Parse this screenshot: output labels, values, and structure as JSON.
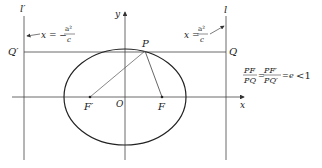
{
  "labels": {
    "l_prime": "l′",
    "l": "l",
    "y_axis": "y",
    "x_axis": "x",
    "origin": "O",
    "Q_prime": "Q′",
    "Q": "Q",
    "P": "P",
    "F_prime": "F′",
    "F": "F"
  },
  "left_directrix_eq": {
    "lhs": "x = −",
    "num": "a²",
    "den": "c"
  },
  "right_directrix_eq": {
    "lhs": "x =",
    "num": "a²",
    "den": "c"
  },
  "eccentricity_relation": {
    "frac1_num": "PF",
    "frac1_den": "PQ",
    "eq1": "=",
    "frac2_num": "PF′",
    "frac2_den": "PQ′",
    "eq2": "=",
    "e": "e",
    "rel": "<1"
  },
  "colors": {
    "stroke": "#333333",
    "thin": "#555555",
    "text": "#222222"
  }
}
